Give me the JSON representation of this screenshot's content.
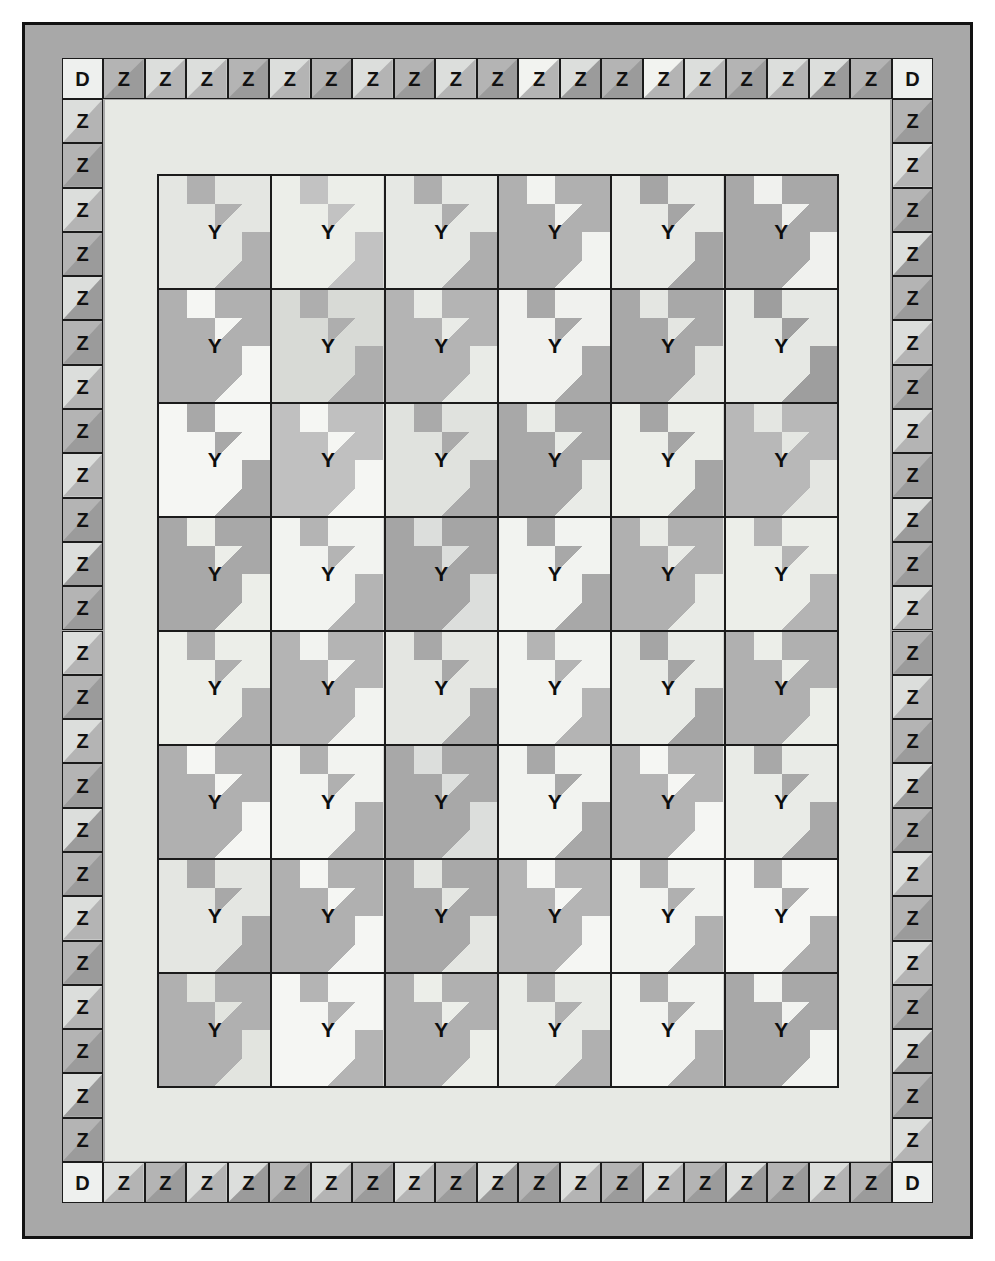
{
  "diagram": {
    "type": "quilt-layout",
    "letters": {
      "corner_block": "D",
      "border_block": "Z",
      "main_block": "Y"
    }
  },
  "palette": {
    "page_background": "#ffffff",
    "outer_border_grey": "#a8a8a8",
    "outline_black": "#121212",
    "inner_sashing": "#e7e9e4",
    "white": "#f5f6f3",
    "light": "#e2e4df",
    "medium": "#b4b4b4",
    "dark": "#9b9b9b"
  },
  "layout": {
    "block_grid": {
      "columns": 6,
      "rows": 8,
      "total_blocks": 48
    },
    "pieced_border": {
      "top_count": 19,
      "bottom_count": 19,
      "left_count": 24,
      "right_count": 24,
      "corner_count": 4
    }
  },
  "pieced_border": {
    "corners": [
      "D",
      "D",
      "D",
      "D"
    ],
    "top": [
      "Z",
      "Z",
      "Z",
      "Z",
      "Z",
      "Z",
      "Z",
      "Z",
      "Z",
      "Z",
      "Z",
      "Z",
      "Z",
      "Z",
      "Z",
      "Z",
      "Z",
      "Z",
      "Z"
    ],
    "bottom": [
      "Z",
      "Z",
      "Z",
      "Z",
      "Z",
      "Z",
      "Z",
      "Z",
      "Z",
      "Z",
      "Z",
      "Z",
      "Z",
      "Z",
      "Z",
      "Z",
      "Z",
      "Z",
      "Z"
    ],
    "left": [
      "Z",
      "Z",
      "Z",
      "Z",
      "Z",
      "Z",
      "Z",
      "Z",
      "Z",
      "Z",
      "Z",
      "Z",
      "Z",
      "Z",
      "Z",
      "Z",
      "Z",
      "Z",
      "Z",
      "Z",
      "Z",
      "Z",
      "Z",
      "Z"
    ],
    "right": [
      "Z",
      "Z",
      "Z",
      "Z",
      "Z",
      "Z",
      "Z",
      "Z",
      "Z",
      "Z",
      "Z",
      "Z",
      "Z",
      "Z",
      "Z",
      "Z",
      "Z",
      "Z",
      "Z",
      "Z",
      "Z",
      "Z",
      "Z",
      "Z"
    ]
  },
  "pieced_border_colors": {
    "top": [
      [
        "#b4b4b4",
        "#9b9b9b"
      ],
      [
        "#dcdedc",
        "#b4b4b4"
      ],
      [
        "#dcdedc",
        "#b4b4b4"
      ],
      [
        "#b4b4b4",
        "#9b9b9b"
      ],
      [
        "#dcdedc",
        "#b4b4b4"
      ],
      [
        "#b4b4b4",
        "#9b9b9b"
      ],
      [
        "#dcdedc",
        "#b4b4b4"
      ],
      [
        "#b4b4b4",
        "#9b9b9b"
      ],
      [
        "#dcdedc",
        "#b4b4b4"
      ],
      [
        "#b4b4b4",
        "#9b9b9b"
      ],
      [
        "#f2f3f0",
        "#b4b4b4"
      ],
      [
        "#dcdedc",
        "#9b9b9b"
      ],
      [
        "#b4b4b4",
        "#9b9b9b"
      ],
      [
        "#f2f3f0",
        "#b4b4b4"
      ],
      [
        "#dcdedc",
        "#b4b4b4"
      ],
      [
        "#b4b4b4",
        "#9b9b9b"
      ],
      [
        "#dcdedc",
        "#b4b4b4"
      ],
      [
        "#dcdedc",
        "#9b9b9b"
      ],
      [
        "#b4b4b4",
        "#9b9b9b"
      ]
    ],
    "bottom": [
      [
        "#dcdedc",
        "#b4b4b4"
      ],
      [
        "#b4b4b4",
        "#9b9b9b"
      ],
      [
        "#dcdedc",
        "#b4b4b4"
      ],
      [
        "#dcdedc",
        "#9b9b9b"
      ],
      [
        "#b4b4b4",
        "#9b9b9b"
      ],
      [
        "#dcdedc",
        "#b4b4b4"
      ],
      [
        "#b4b4b4",
        "#9b9b9b"
      ],
      [
        "#dcdedc",
        "#b4b4b4"
      ],
      [
        "#b4b4b4",
        "#9b9b9b"
      ],
      [
        "#dcdedc",
        "#9b9b9b"
      ],
      [
        "#b4b4b4",
        "#9b9b9b"
      ],
      [
        "#dcdedc",
        "#b4b4b4"
      ],
      [
        "#b4b4b4",
        "#9b9b9b"
      ],
      [
        "#dcdedc",
        "#b4b4b4"
      ],
      [
        "#b4b4b4",
        "#9b9b9b"
      ],
      [
        "#dcdedc",
        "#9b9b9b"
      ],
      [
        "#b4b4b4",
        "#9b9b9b"
      ],
      [
        "#dcdedc",
        "#b4b4b4"
      ],
      [
        "#b4b4b4",
        "#9b9b9b"
      ]
    ],
    "left": [
      [
        "#dcdedc",
        "#b4b4b4"
      ],
      [
        "#b4b4b4",
        "#9b9b9b"
      ],
      [
        "#dcdedc",
        "#b4b4b4"
      ],
      [
        "#b4b4b4",
        "#9b9b9b"
      ],
      [
        "#dcdedc",
        "#9b9b9b"
      ],
      [
        "#b4b4b4",
        "#9b9b9b"
      ],
      [
        "#dcdedc",
        "#b4b4b4"
      ],
      [
        "#b4b4b4",
        "#9b9b9b"
      ],
      [
        "#dcdedc",
        "#b4b4b4"
      ],
      [
        "#b4b4b4",
        "#9b9b9b"
      ],
      [
        "#dcdedc",
        "#9b9b9b"
      ],
      [
        "#b4b4b4",
        "#9b9b9b"
      ],
      [
        "#dcdedc",
        "#b4b4b4"
      ],
      [
        "#b4b4b4",
        "#9b9b9b"
      ],
      [
        "#dcdedc",
        "#b4b4b4"
      ],
      [
        "#b4b4b4",
        "#9b9b9b"
      ],
      [
        "#dcdedc",
        "#9b9b9b"
      ],
      [
        "#b4b4b4",
        "#9b9b9b"
      ],
      [
        "#dcdedc",
        "#b4b4b4"
      ],
      [
        "#b4b4b4",
        "#9b9b9b"
      ],
      [
        "#dcdedc",
        "#b4b4b4"
      ],
      [
        "#b4b4b4",
        "#9b9b9b"
      ],
      [
        "#dcdedc",
        "#9b9b9b"
      ],
      [
        "#b4b4b4",
        "#9b9b9b"
      ]
    ],
    "right": [
      [
        "#b4b4b4",
        "#9b9b9b"
      ],
      [
        "#dcdedc",
        "#b4b4b4"
      ],
      [
        "#b4b4b4",
        "#9b9b9b"
      ],
      [
        "#dcdedc",
        "#9b9b9b"
      ],
      [
        "#b4b4b4",
        "#9b9b9b"
      ],
      [
        "#dcdedc",
        "#b4b4b4"
      ],
      [
        "#b4b4b4",
        "#9b9b9b"
      ],
      [
        "#dcdedc",
        "#b4b4b4"
      ],
      [
        "#b4b4b4",
        "#9b9b9b"
      ],
      [
        "#dcdedc",
        "#9b9b9b"
      ],
      [
        "#b4b4b4",
        "#9b9b9b"
      ],
      [
        "#dcdedc",
        "#b4b4b4"
      ],
      [
        "#b4b4b4",
        "#9b9b9b"
      ],
      [
        "#dcdedc",
        "#b4b4b4"
      ],
      [
        "#b4b4b4",
        "#9b9b9b"
      ],
      [
        "#dcdedc",
        "#9b9b9b"
      ],
      [
        "#b4b4b4",
        "#9b9b9b"
      ],
      [
        "#dcdedc",
        "#b4b4b4"
      ],
      [
        "#b4b4b4",
        "#9b9b9b"
      ],
      [
        "#dcdedc",
        "#b4b4b4"
      ],
      [
        "#b4b4b4",
        "#9b9b9b"
      ],
      [
        "#dcdedc",
        "#9b9b9b"
      ],
      [
        "#b4b4b4",
        "#9b9b9b"
      ],
      [
        "#dcdedc",
        "#b4b4b4"
      ]
    ]
  },
  "blocks": [
    [
      {
        "label": "Y",
        "bg": "#b0b0b0",
        "fg": "#e4e6e2"
      },
      {
        "label": "Y",
        "bg": "#c2c2c2",
        "fg": "#eceee9"
      },
      {
        "label": "Y",
        "bg": "#aeaeae",
        "fg": "#e6e8e4"
      },
      {
        "label": "Y",
        "bg": "#f2f3f0",
        "fg": "#b0b0b0"
      },
      {
        "label": "Y",
        "bg": "#a5a5a5",
        "fg": "#e8eae6"
      },
      {
        "label": "Y",
        "bg": "#f0f1ee",
        "fg": "#a8a8a8"
      }
    ],
    [
      {
        "label": "Y",
        "bg": "#f5f6f3",
        "fg": "#b0b0b0"
      },
      {
        "label": "Y",
        "bg": "#aeaeae",
        "fg": "#d8dad6"
      },
      {
        "label": "Y",
        "bg": "#e9ebe7",
        "fg": "#b4b4b4"
      },
      {
        "label": "Y",
        "bg": "#a8a8a8",
        "fg": "#f0f1ee"
      },
      {
        "label": "Y",
        "bg": "#e4e6e2",
        "fg": "#a8a8a8"
      },
      {
        "label": "Y",
        "bg": "#9e9e9e",
        "fg": "#e6e8e4"
      }
    ],
    [
      {
        "label": "Y",
        "bg": "#a8a8a8",
        "fg": "#f5f6f3"
      },
      {
        "label": "Y",
        "bg": "#f5f6f3",
        "fg": "#c0c0c0"
      },
      {
        "label": "Y",
        "bg": "#aaaaaa",
        "fg": "#e0e2de"
      },
      {
        "label": "Y",
        "bg": "#e9ebe7",
        "fg": "#a8a8a8"
      },
      {
        "label": "Y",
        "bg": "#a5a5a5",
        "fg": "#eceee9"
      },
      {
        "label": "Y",
        "bg": "#e4e6e2",
        "fg": "#b8b8b8"
      }
    ],
    [
      {
        "label": "Y",
        "bg": "#eceee9",
        "fg": "#a8a8a8"
      },
      {
        "label": "Y",
        "bg": "#b4b4b4",
        "fg": "#f2f3f0"
      },
      {
        "label": "Y",
        "bg": "#dcdedc",
        "fg": "#a5a5a5"
      },
      {
        "label": "Y",
        "bg": "#a8a8a8",
        "fg": "#f2f3f0"
      },
      {
        "label": "Y",
        "bg": "#e9ebe7",
        "fg": "#b0b0b0"
      },
      {
        "label": "Y",
        "bg": "#b4b4b4",
        "fg": "#eceee9"
      }
    ],
    [
      {
        "label": "Y",
        "bg": "#aeaeae",
        "fg": "#eceee9"
      },
      {
        "label": "Y",
        "bg": "#f2f3f0",
        "fg": "#b4b4b4"
      },
      {
        "label": "Y",
        "bg": "#a8a8a8",
        "fg": "#e4e6e2"
      },
      {
        "label": "Y",
        "bg": "#b4b4b4",
        "fg": "#f2f3f0"
      },
      {
        "label": "Y",
        "bg": "#a5a5a5",
        "fg": "#e9ebe7"
      },
      {
        "label": "Y",
        "bg": "#eceee9",
        "fg": "#b0b0b0"
      }
    ],
    [
      {
        "label": "Y",
        "bg": "#f5f6f3",
        "fg": "#b0b0b0"
      },
      {
        "label": "Y",
        "bg": "#b0b0b0",
        "fg": "#f2f3f0"
      },
      {
        "label": "Y",
        "bg": "#dcdedc",
        "fg": "#a8a8a8"
      },
      {
        "label": "Y",
        "bg": "#a8a8a8",
        "fg": "#f2f3f0"
      },
      {
        "label": "Y",
        "bg": "#f5f6f3",
        "fg": "#b4b4b4"
      },
      {
        "label": "Y",
        "bg": "#a8a8a8",
        "fg": "#e9ebe7"
      }
    ],
    [
      {
        "label": "Y",
        "bg": "#a8a8a8",
        "fg": "#e4e6e2"
      },
      {
        "label": "Y",
        "bg": "#f5f6f3",
        "fg": "#b0b0b0"
      },
      {
        "label": "Y",
        "bg": "#e4e6e2",
        "fg": "#a8a8a8"
      },
      {
        "label": "Y",
        "bg": "#f5f6f3",
        "fg": "#b4b4b4"
      },
      {
        "label": "Y",
        "bg": "#b0b0b0",
        "fg": "#f2f3f0"
      },
      {
        "label": "Y",
        "bg": "#aeaeae",
        "fg": "#f5f6f3"
      }
    ],
    [
      {
        "label": "Y",
        "bg": "#e2e4df",
        "fg": "#b0b0b0"
      },
      {
        "label": "Y",
        "bg": "#b4b4b4",
        "fg": "#f5f6f3"
      },
      {
        "label": "Y",
        "bg": "#eceee9",
        "fg": "#b0b0b0"
      },
      {
        "label": "Y",
        "bg": "#b0b0b0",
        "fg": "#e9ebe7"
      },
      {
        "label": "Y",
        "bg": "#aeaeae",
        "fg": "#f2f3f0"
      },
      {
        "label": "Y",
        "bg": "#f2f3f0",
        "fg": "#a8a8a8"
      }
    ]
  ]
}
